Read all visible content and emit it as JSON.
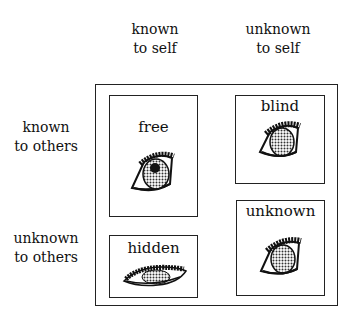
{
  "columns": [
    {
      "line1": "known",
      "line2": "to self"
    },
    {
      "line1": "unknown",
      "line2": "to self"
    }
  ],
  "rows": [
    {
      "line1": "known",
      "line2": "to others"
    },
    {
      "line1": "unknown",
      "line2": "to others"
    }
  ],
  "panes": {
    "free": {
      "title": "free",
      "icon": "open-eye-icon"
    },
    "blind": {
      "title": "blind",
      "icon": "open-eye-icon"
    },
    "hidden": {
      "title": "hidden",
      "icon": "half-closed-eye-icon"
    },
    "unknown": {
      "title": "unknown",
      "icon": "open-eye-icon"
    }
  },
  "colors": {
    "ink": "#111111",
    "background": "#ffffff"
  }
}
